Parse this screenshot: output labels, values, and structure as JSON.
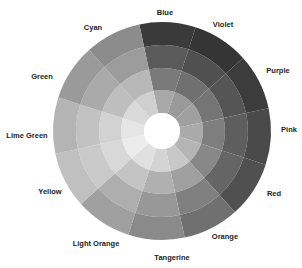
{
  "chart_data": {
    "type": "sunburst",
    "title": "",
    "center": [
      162,
      131
    ],
    "ring_radii": [
      18,
      41,
      63,
      86,
      109
    ],
    "start_angle_deg": -12,
    "segment_sweep_deg": 30,
    "categories": [
      "Blue",
      "Violet",
      "Purple",
      "Pink",
      "Red",
      "Orange",
      "Tangerine",
      "Light Orange",
      "Yellow",
      "Lime Green",
      "Green",
      "Cyan"
    ],
    "values": [
      1,
      1,
      1,
      1,
      1,
      1,
      1,
      1,
      1,
      1,
      1,
      1
    ],
    "rings": 4,
    "shades_inner_to_outer": [
      [
        "#a8a8a8",
        "#7a7a7a",
        "#5a5a5a",
        "#3a3a3a"
      ],
      [
        "#9a9a9a",
        "#707070",
        "#505050",
        "#353535"
      ],
      [
        "#a0a0a0",
        "#757575",
        "#555555",
        "#3c3c3c"
      ],
      [
        "#aaaaaa",
        "#7e7e7e",
        "#5e5e5e",
        "#4a4a4a"
      ],
      [
        "#b5b5b5",
        "#888888",
        "#656565",
        "#505050"
      ],
      [
        "#c8c8c8",
        "#a0a0a0",
        "#808080",
        "#707070"
      ],
      [
        "#d4d4d4",
        "#b0b0b0",
        "#989898",
        "#8a8a8a"
      ],
      [
        "#e0e0e0",
        "#c4c4c4",
        "#aeaeae",
        "#a0a0a0"
      ],
      [
        "#ececec",
        "#d8d8d8",
        "#cacaca",
        "#c0c0c0"
      ],
      [
        "#e6e6e6",
        "#d2d2d2",
        "#c2c2c2",
        "#b4b4b4"
      ],
      [
        "#dadada",
        "#bebebe",
        "#aaaaaa",
        "#9a9a9a"
      ],
      [
        "#d0d0d0",
        "#b8b8b8",
        "#9c9c9c",
        "#8c8c8c"
      ]
    ],
    "legend_position": "labels around wheel",
    "grid": false
  },
  "labels": [
    {
      "text": "Blue",
      "x": 165,
      "y": 12
    },
    {
      "text": "Violet",
      "x": 223,
      "y": 24
    },
    {
      "text": "Purple",
      "x": 278,
      "y": 70
    },
    {
      "text": "Pink",
      "x": 289,
      "y": 129
    },
    {
      "text": "Red",
      "x": 274,
      "y": 193
    },
    {
      "text": "Orange",
      "x": 225,
      "y": 236
    },
    {
      "text": "Tangerine",
      "x": 172,
      "y": 257
    },
    {
      "text": "Light Orange",
      "x": 96,
      "y": 243
    },
    {
      "text": "Yellow",
      "x": 50,
      "y": 191
    },
    {
      "text": "Lime Green",
      "x": 27,
      "y": 135
    },
    {
      "text": "Green",
      "x": 42,
      "y": 76
    },
    {
      "text": "Cyan",
      "x": 93,
      "y": 27
    }
  ]
}
